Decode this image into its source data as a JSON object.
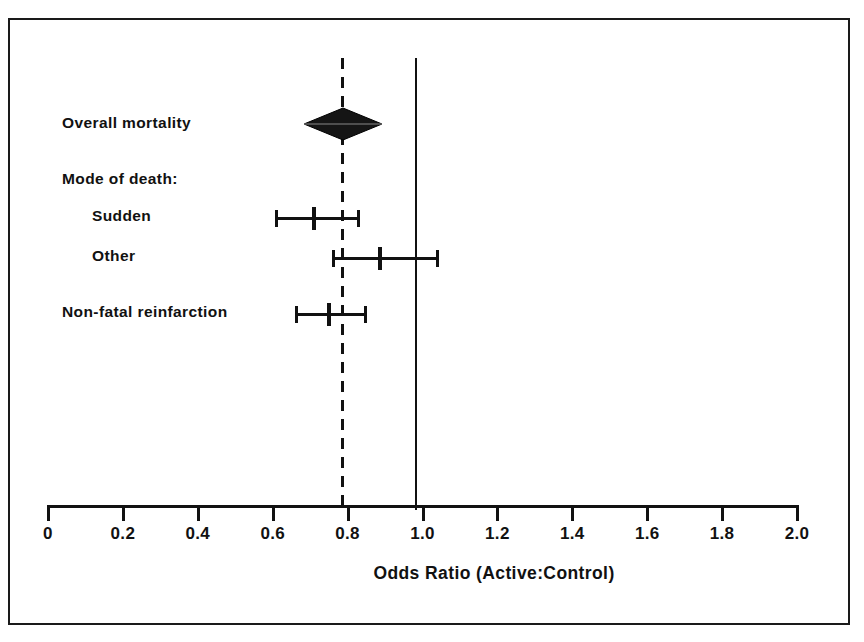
{
  "figure": {
    "kind": "forest-plot",
    "background": "#ffffff",
    "ink_color": "#111111"
  },
  "chart_data": {
    "type": "scatter",
    "subtype": "forest-plot",
    "title": "",
    "xlabel": "Odds Ratio (Active:Control)",
    "ylabel": "",
    "xlim": [
      0,
      2.0
    ],
    "xticks": [
      0,
      0.2,
      0.4,
      0.6,
      0.8,
      1.0,
      1.2,
      1.4,
      1.6,
      1.8,
      2.0
    ],
    "xtick_labels": [
      "0",
      "0.2",
      "0.4",
      "0.6",
      "0.8",
      "1.0",
      "1.2",
      "1.4",
      "1.6",
      "1.8",
      "2.0"
    ],
    "grid": false,
    "legend": false,
    "reference_lines": [
      {
        "name": "no-effect-line",
        "x": 1.0,
        "style": "solid"
      },
      {
        "name": "pooled-estimate-line",
        "x": 0.8,
        "style": "dashed"
      }
    ],
    "rows": [
      {
        "label": "Overall mortality",
        "marker": "diamond",
        "estimate": 0.8,
        "ci_low": 0.74,
        "ci_high": 0.86,
        "is_header": false
      },
      {
        "label": "Mode of death:",
        "marker": "none",
        "estimate": null,
        "ci_low": null,
        "ci_high": null,
        "is_header": true
      },
      {
        "label": "Sudden",
        "marker": "line",
        "estimate": 0.71,
        "ci_low": 0.61,
        "ci_high": 0.83,
        "is_header": false
      },
      {
        "label": "Other",
        "marker": "line",
        "estimate": 0.88,
        "ci_low": 0.76,
        "ci_high": 1.04,
        "is_header": false
      },
      {
        "label": "Non-fatal reinfarction",
        "marker": "line",
        "estimate": 0.75,
        "ci_low": 0.66,
        "ci_high": 0.85,
        "is_header": false
      }
    ]
  },
  "axis": {
    "title": "Odds Ratio (Active:Control)",
    "labels": [
      "0",
      "0.2",
      "0.4",
      "0.6",
      "0.8",
      "1.0",
      "1.2",
      "1.4",
      "1.6",
      "1.8",
      "2.0"
    ]
  },
  "rows": {
    "overall_mortality": "Overall mortality",
    "mode_of_death": "Mode of death:",
    "sudden": "Sudden",
    "other": "Other",
    "non_fatal_reinfarction": "Non-fatal reinfarction"
  }
}
